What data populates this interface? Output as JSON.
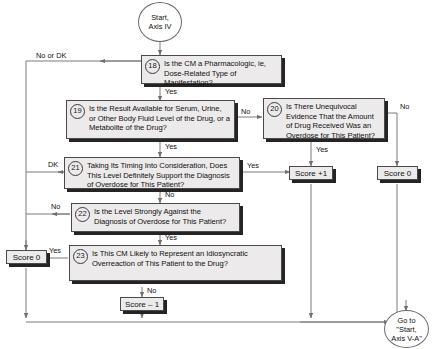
{
  "diagram": {
    "start": {
      "name": "start-terminal",
      "line1": "Start,",
      "line2": "Axis IV"
    },
    "end": {
      "name": "goto-terminal",
      "line1": "Go to",
      "line2": "\"Start,",
      "line3": "Axis V-A\""
    },
    "questions": [
      {
        "id": "18",
        "number": "18",
        "text": "Is the CM a Pharmacologic, ie, Dose-Related Type of Manifestation?"
      },
      {
        "id": "19",
        "number": "19",
        "text": "Is the Result Available for Serum, Urine, or Other Body Fluid Level of the Drug, or a Metabolite of the Drug?"
      },
      {
        "id": "20",
        "number": "20",
        "text": "Is There Unequivocal Evidence That the Amount of Drug Received Was an Overdose for This Patient?"
      },
      {
        "id": "21",
        "number": "21",
        "text": "Taking Its Timing Into Consideration, Does This Level Definitely Support the Diagnosis of Overdose for This Patient?"
      },
      {
        "id": "22",
        "number": "22",
        "text": "Is the Level Strongly Against the Diagnosis of Overdose for This Patient?"
      },
      {
        "id": "23",
        "number": "23",
        "text": "Is This CM Likely to Represent an Idiosyncratic Overreaction of This Patient to the Drug?"
      }
    ],
    "scores": [
      {
        "id": "score-left",
        "label": "Score 0"
      },
      {
        "id": "score-plus1",
        "label": "Score +1"
      },
      {
        "id": "score-right",
        "label": "Score 0"
      },
      {
        "id": "score-minus1",
        "label": "Score – 1"
      }
    ],
    "edge_labels": [
      {
        "id": "e18-no",
        "text": "No or DK"
      },
      {
        "id": "e18-yes",
        "text": "Yes"
      },
      {
        "id": "e19-yes",
        "text": "Yes"
      },
      {
        "id": "e19-no",
        "text": "No"
      },
      {
        "id": "e20-yes",
        "text": "Yes"
      },
      {
        "id": "e20-no",
        "text": "No"
      },
      {
        "id": "e21-dk",
        "text": "DK"
      },
      {
        "id": "e21-yes",
        "text": "Yes"
      },
      {
        "id": "e21-no",
        "text": "No"
      },
      {
        "id": "e22-no",
        "text": "No"
      },
      {
        "id": "e22-yes",
        "text": "Yes"
      },
      {
        "id": "e23-yes",
        "text": "Yes"
      },
      {
        "id": "e23-no",
        "text": "No"
      }
    ],
    "colors": {
      "box_fill": "#eceaea",
      "box_border": "#4a4a4a",
      "shadow": "#242424",
      "line": "#7a7a7a",
      "text": "#111111",
      "background": "#ffffff"
    }
  }
}
